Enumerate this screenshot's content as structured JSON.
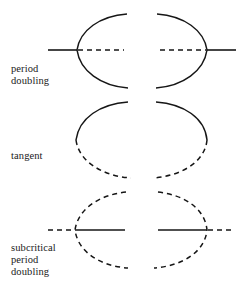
{
  "figure": {
    "type": "bifurcation-diagram",
    "background": "#ffffff",
    "stroke_color": "#161616",
    "width": 248,
    "height": 293,
    "panels": [
      {
        "id": "period-doubling",
        "label": "period\ndoubling",
        "label_line1": "period",
        "label_line2": "doubling",
        "label_x": 11,
        "label_y": 63,
        "axis_y": 50,
        "left_branch_point_x": 77,
        "right_branch_point_x": 207,
        "left_axis_solid": {
          "x1": 48,
          "x2": 77
        },
        "left_axis_dashed": {
          "x1": 77,
          "x2": 124
        },
        "right_axis_dashed": {
          "x1": 160,
          "x2": 207
        },
        "right_axis_solid": {
          "x1": 207,
          "x2": 236
        },
        "left_arc_style": "solid",
        "right_arc_style": "solid",
        "arc_top_y": 14,
        "arc_bottom_y": 88,
        "arc_open_toward": "center"
      },
      {
        "id": "tangent",
        "label": "tangent",
        "label_line1": "tangent",
        "label_x": 11,
        "label_y": 150,
        "axis_y": null,
        "left_upper_style": "solid",
        "left_lower_style": "dashed",
        "right_upper_style": "solid",
        "right_lower_style": "dashed",
        "arc_top_y": 102,
        "arc_bottom_y": 178,
        "turning_point_left_x": 76,
        "turning_point_right_x": 207,
        "turning_point_y": 140
      },
      {
        "id": "subcritical-period-doubling",
        "label": "subcritical\nperiod\ndoubling",
        "label_line1": "subcritical",
        "label_line2": "period",
        "label_line3": "doubling",
        "label_x": 11,
        "label_y": 242,
        "axis_y": 230,
        "left_branch_point_x": 75,
        "right_branch_point_x": 207,
        "left_axis_dashed": {
          "x1": 48,
          "x2": 75
        },
        "left_axis_solid": {
          "x1": 75,
          "x2": 125
        },
        "right_axis_solid": {
          "x1": 158,
          "x2": 207
        },
        "right_axis_dashed": {
          "x1": 207,
          "x2": 234
        },
        "left_arc_style": "dashed",
        "right_arc_style": "dashed",
        "arc_top_y": 192,
        "arc_bottom_y": 268,
        "arc_open_toward": "center"
      }
    ]
  }
}
